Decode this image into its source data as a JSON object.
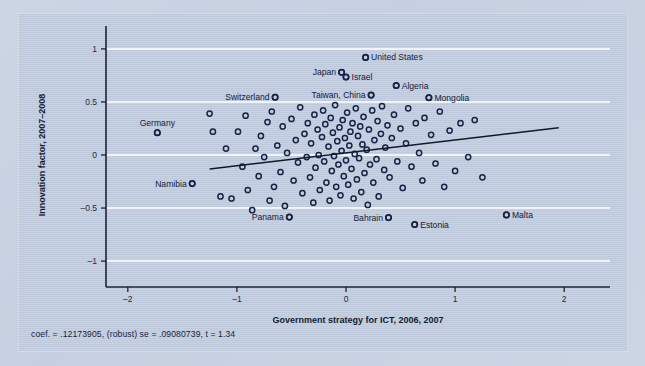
{
  "figure": {
    "background_color": "#c6d0e0",
    "panel_color": "#c2cddf",
    "marker_color": "#172445",
    "gridline_color": "#ffffff",
    "axis_color": "#1c2438"
  },
  "footnote": {
    "text": "coef. = .12173905, (robust) se = .09080739, t = 1.34"
  },
  "chart_data": {
    "type": "scatter",
    "title": "",
    "xlabel": "Government strategy for ICT, 2006, 2007",
    "ylabel": "Innovation factor, 2007–2008",
    "xlim": [
      -2.2,
      2.2
    ],
    "ylim": [
      -1.15,
      1.15
    ],
    "xticks": [
      -2,
      -1,
      0,
      1,
      2
    ],
    "xtick_labels": [
      "–2",
      "–1",
      "0",
      "1",
      "2"
    ],
    "yticks": [
      -1,
      -0.5,
      0,
      0.5,
      1
    ],
    "ytick_labels": [
      "–1",
      "–0.5",
      "0",
      "0.5",
      "1"
    ],
    "grid": "horizontal",
    "legend": "none",
    "fit_line": {
      "coef": 0.12173905,
      "robust_se": 0.09080739,
      "t": 1.34,
      "intercept": 0.02,
      "x_start": -1.25,
      "x_end": 1.95
    },
    "labeled_points": [
      {
        "label": "United States",
        "x": 0.18,
        "y": 0.92,
        "side": "left"
      },
      {
        "label": "Japan",
        "x": -0.04,
        "y": 0.78,
        "side": "right"
      },
      {
        "label": "Israel",
        "x": 0.0,
        "y": 0.735,
        "side": "left"
      },
      {
        "label": "Algeria",
        "x": 0.46,
        "y": 0.655,
        "side": "left"
      },
      {
        "label": "Switzerland",
        "x": -0.65,
        "y": 0.545,
        "side": "right"
      },
      {
        "label": "Taiwan, China",
        "x": 0.23,
        "y": 0.565,
        "side": "right"
      },
      {
        "label": "Mongolia",
        "x": 0.76,
        "y": 0.54,
        "side": "left"
      },
      {
        "label": "Germany",
        "x": -1.73,
        "y": 0.21,
        "side": "above"
      },
      {
        "label": "Namibia",
        "x": -1.41,
        "y": -0.27,
        "side": "right"
      },
      {
        "label": "Panama",
        "x": -0.52,
        "y": -0.585,
        "side": "right"
      },
      {
        "label": "Bahrain",
        "x": 0.39,
        "y": -0.59,
        "side": "right"
      },
      {
        "label": "Estonia",
        "x": 0.63,
        "y": -0.655,
        "side": "left"
      },
      {
        "label": "Malta",
        "x": 1.47,
        "y": -0.565,
        "side": "left"
      }
    ],
    "points": [
      [
        -1.73,
        0.21
      ],
      [
        -1.41,
        -0.27
      ],
      [
        -1.25,
        0.39
      ],
      [
        -1.22,
        0.22
      ],
      [
        -1.15,
        -0.39
      ],
      [
        -1.1,
        0.06
      ],
      [
        -1.05,
        -0.41
      ],
      [
        -0.99,
        0.22
      ],
      [
        -0.95,
        -0.11
      ],
      [
        -0.92,
        0.37
      ],
      [
        -0.9,
        -0.33
      ],
      [
        -0.86,
        -0.52
      ],
      [
        -0.83,
        0.06
      ],
      [
        -0.8,
        -0.2
      ],
      [
        -0.78,
        0.18
      ],
      [
        -0.75,
        -0.02
      ],
      [
        -0.72,
        0.31
      ],
      [
        -0.7,
        -0.43
      ],
      [
        -0.68,
        0.41
      ],
      [
        -0.66,
        -0.3
      ],
      [
        -0.65,
        0.545
      ],
      [
        -0.63,
        0.09
      ],
      [
        -0.6,
        -0.16
      ],
      [
        -0.58,
        0.27
      ],
      [
        -0.56,
        -0.48
      ],
      [
        -0.54,
        0.02
      ],
      [
        -0.52,
        -0.585
      ],
      [
        -0.5,
        0.34
      ],
      [
        -0.48,
        -0.24
      ],
      [
        -0.46,
        0.14
      ],
      [
        -0.44,
        -0.07
      ],
      [
        -0.42,
        0.45
      ],
      [
        -0.4,
        -0.36
      ],
      [
        -0.38,
        0.2
      ],
      [
        -0.36,
        -0.02
      ],
      [
        -0.35,
        0.3
      ],
      [
        -0.33,
        -0.21
      ],
      [
        -0.32,
        0.11
      ],
      [
        -0.3,
        -0.45
      ],
      [
        -0.29,
        0.38
      ],
      [
        -0.28,
        -0.12
      ],
      [
        -0.26,
        0.24
      ],
      [
        -0.25,
        0.0
      ],
      [
        -0.24,
        -0.33
      ],
      [
        -0.22,
        0.17
      ],
      [
        -0.21,
        0.42
      ],
      [
        -0.2,
        -0.06
      ],
      [
        -0.19,
        0.29
      ],
      [
        -0.18,
        -0.26
      ],
      [
        -0.16,
        0.08
      ],
      [
        -0.15,
        -0.43
      ],
      [
        -0.14,
        0.35
      ],
      [
        -0.13,
        -0.15
      ],
      [
        -0.12,
        0.21
      ],
      [
        -0.11,
        -0.01
      ],
      [
        -0.1,
        0.47
      ],
      [
        -0.09,
        -0.3
      ],
      [
        -0.08,
        0.13
      ],
      [
        -0.07,
        -0.09
      ],
      [
        -0.06,
        0.26
      ],
      [
        -0.05,
        -0.38
      ],
      [
        -0.04,
        0.78
      ],
      [
        -0.04,
        0.04
      ],
      [
        -0.03,
        0.33
      ],
      [
        -0.02,
        -0.2
      ],
      [
        -0.01,
        0.16
      ],
      [
        0.0,
        0.735
      ],
      [
        0.0,
        -0.05
      ],
      [
        0.01,
        0.4
      ],
      [
        0.02,
        -0.28
      ],
      [
        0.03,
        0.09
      ],
      [
        0.04,
        0.22
      ],
      [
        0.05,
        -0.13
      ],
      [
        0.06,
        0.3
      ],
      [
        0.07,
        -0.41
      ],
      [
        0.08,
        0.01
      ],
      [
        0.09,
        0.44
      ],
      [
        0.1,
        -0.23
      ],
      [
        0.11,
        0.18
      ],
      [
        0.12,
        -0.03
      ],
      [
        0.13,
        0.27
      ],
      [
        0.14,
        -0.35
      ],
      [
        0.15,
        0.1
      ],
      [
        0.16,
        0.36
      ],
      [
        0.17,
        -0.17
      ],
      [
        0.18,
        0.92
      ],
      [
        0.19,
        0.05
      ],
      [
        0.2,
        -0.47
      ],
      [
        0.21,
        0.24
      ],
      [
        0.22,
        -0.09
      ],
      [
        0.23,
        0.565
      ],
      [
        0.24,
        0.42
      ],
      [
        0.25,
        -0.26
      ],
      [
        0.26,
        0.14
      ],
      [
        0.28,
        -0.04
      ],
      [
        0.29,
        0.32
      ],
      [
        0.3,
        -0.39
      ],
      [
        0.32,
        0.2
      ],
      [
        0.33,
        0.46
      ],
      [
        0.35,
        -0.14
      ],
      [
        0.36,
        0.07
      ],
      [
        0.38,
        0.28
      ],
      [
        0.39,
        -0.59
      ],
      [
        0.4,
        -0.21
      ],
      [
        0.42,
        0.16
      ],
      [
        0.44,
        0.38
      ],
      [
        0.46,
        0.655
      ],
      [
        0.47,
        -0.06
      ],
      [
        0.5,
        0.25
      ],
      [
        0.52,
        -0.31
      ],
      [
        0.55,
        0.11
      ],
      [
        0.57,
        0.44
      ],
      [
        0.6,
        -0.11
      ],
      [
        0.63,
        -0.655
      ],
      [
        0.64,
        0.3
      ],
      [
        0.67,
        0.02
      ],
      [
        0.7,
        -0.24
      ],
      [
        0.72,
        0.35
      ],
      [
        0.76,
        0.54
      ],
      [
        0.78,
        0.19
      ],
      [
        0.82,
        -0.08
      ],
      [
        0.86,
        0.41
      ],
      [
        0.9,
        -0.3
      ],
      [
        0.95,
        0.23
      ],
      [
        1.0,
        -0.15
      ],
      [
        1.05,
        0.3
      ],
      [
        1.12,
        -0.02
      ],
      [
        1.18,
        0.33
      ],
      [
        1.25,
        -0.21
      ],
      [
        1.47,
        -0.565
      ]
    ]
  }
}
